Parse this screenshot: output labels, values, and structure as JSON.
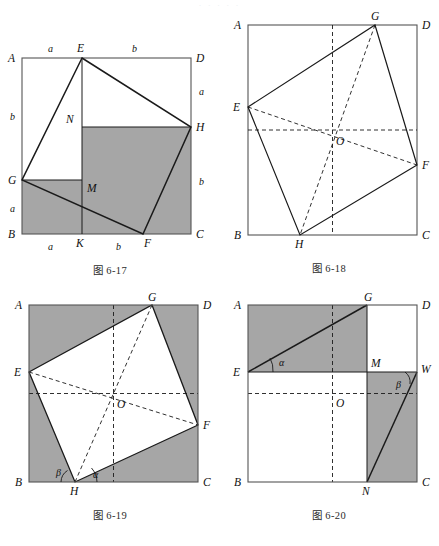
{
  "page": {
    "top_cut_text": "· · · · ·",
    "background_color": "#ffffff",
    "shade_color": "#a6a6a6",
    "line_color": "#1a1a1a",
    "frame_color": "#555555"
  },
  "figures": [
    {
      "id": "fig-6-17",
      "caption": "图 6-17",
      "square_vertices": [
        "A",
        "B",
        "C",
        "D"
      ],
      "inner_points": [
        "E",
        "F",
        "G",
        "H",
        "K",
        "M",
        "N"
      ],
      "side_labels": [
        "a",
        "b",
        "a",
        "b",
        "a",
        "b",
        "b",
        "a"
      ],
      "labels": {
        "A": "A",
        "B": "B",
        "C": "C",
        "D": "D",
        "E": "E",
        "F": "F",
        "G": "G",
        "H": "H",
        "K": "K",
        "M": "M",
        "N": "N",
        "top_left_seg": "a",
        "top_right_seg": "b",
        "left_upper_seg": "b",
        "left_lower_seg": "a",
        "right_upper_seg": "a",
        "right_lower_seg": "b",
        "bottom_left_seg": "a",
        "bottom_mid_seg": "a",
        "bottom_right_seg": "b"
      },
      "shaded_description": "polygon G-B-F-H-N-M region shaded grey"
    },
    {
      "id": "fig-6-18",
      "caption": "图 6-18",
      "square_vertices": [
        "A",
        "B",
        "C",
        "D"
      ],
      "inner_points": [
        "E",
        "F",
        "G",
        "H",
        "O"
      ],
      "labels": {
        "A": "A",
        "B": "B",
        "C": "C",
        "D": "D",
        "E": "E",
        "F": "F",
        "G": "G",
        "H": "H",
        "O": "O"
      },
      "shaded_description": "unshaded; inscribed quadrilateral EGFH with dashed diagonals through centre O"
    },
    {
      "id": "fig-6-19",
      "caption": "图 6-19",
      "square_vertices": [
        "A",
        "B",
        "C",
        "D"
      ],
      "inner_points": [
        "E",
        "F",
        "G",
        "H",
        "O"
      ],
      "angles": [
        "α",
        "β"
      ],
      "labels": {
        "A": "A",
        "B": "B",
        "C": "C",
        "D": "D",
        "E": "E",
        "F": "F",
        "G": "G",
        "H": "H",
        "O": "O",
        "alpha": "α",
        "beta": "β"
      },
      "shaded_description": "square ABCD shaded grey except inscribed quadrilateral EGFH which is white"
    },
    {
      "id": "fig-6-20",
      "caption": "图 6-20",
      "square_vertices": [
        "A",
        "B",
        "C",
        "D"
      ],
      "inner_points": [
        "E",
        "G",
        "M",
        "N",
        "O",
        "W"
      ],
      "angles": [
        "α",
        "β"
      ],
      "labels": {
        "A": "A",
        "B": "B",
        "C": "C",
        "D": "D",
        "E": "E",
        "G": "G",
        "M": "M",
        "N": "N",
        "O": "O",
        "W": "W",
        "alpha": "α",
        "beta": "β"
      },
      "shaded_description": "rectangle AEMG shaded grey, and rectangle MWCN shaded grey with line N-W drawn"
    }
  ]
}
